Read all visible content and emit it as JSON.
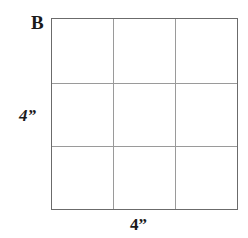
{
  "figure": {
    "corner_label": "B",
    "left_dimension": "4”",
    "bottom_dimension": "4”",
    "shape": "square",
    "grid_columns": 3,
    "grid_rows": 3,
    "border_color": "#6b6b6b",
    "grid_line_color": "#9a9a9a",
    "background_color": "#ffffff",
    "text_color": "#1a1a1a"
  }
}
